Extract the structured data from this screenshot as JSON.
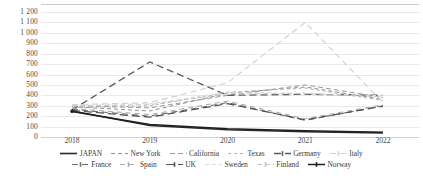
{
  "chart_data": {
    "type": "line",
    "title": "",
    "xlabel": "",
    "ylabel": "",
    "categories": [
      "2018",
      "2019",
      "2020",
      "2021",
      "2022"
    ],
    "x": [
      2018,
      2019,
      2020,
      2021,
      2022
    ],
    "ylim": [
      0,
      1200
    ],
    "y_ticks": [
      "0",
      "100",
      "200",
      "300",
      "400",
      "500",
      "600",
      "700",
      "800",
      "900",
      "1 000",
      "1 100",
      "1 200"
    ],
    "y_tick_values": [
      0,
      100,
      200,
      300,
      400,
      500,
      600,
      700,
      800,
      900,
      1000,
      1100,
      1200
    ],
    "grid": true,
    "legend_position": "bottom",
    "series": [
      {
        "name": "JAPAN",
        "values": [
          250,
          110,
          70,
          50,
          40
        ],
        "color": "#2b2b2b",
        "dash": "none",
        "width": 1.6,
        "marker": "none"
      },
      {
        "name": "New York",
        "values": [
          290,
          250,
          420,
          480,
          360
        ],
        "color": "#8f8f8f",
        "dash": "4,3",
        "width": 1.0,
        "marker": "none"
      },
      {
        "name": "California",
        "values": [
          300,
          280,
          400,
          500,
          380
        ],
        "color": "#9a9a9a",
        "dash": "5,3",
        "width": 1.0,
        "marker": "none"
      },
      {
        "name": "Texas",
        "values": [
          280,
          300,
          430,
          470,
          350
        ],
        "color": "#b4b4b4",
        "dash": "3,3",
        "width": 1.0,
        "marker": "none"
      },
      {
        "name": "Germany",
        "values": [
          260,
          720,
          400,
          410,
          400
        ],
        "color": "#5a5a5a",
        "dash": "7,4",
        "width": 1.3,
        "marker": "dash"
      },
      {
        "name": "Italy",
        "values": [
          310,
          330,
          520,
          1100,
          330
        ],
        "color": "#cfcfcf",
        "dash": "6,4",
        "width": 1.1,
        "marker": "dash"
      },
      {
        "name": "France",
        "values": [
          265,
          200,
          330,
          160,
          300
        ],
        "color": "#6f6f6f",
        "dash": "6,4",
        "width": 1.1,
        "marker": "dash"
      },
      {
        "name": "Spain",
        "values": [
          275,
          215,
          345,
          175,
          310
        ],
        "color": "#a8a8a8",
        "dash": "5,4",
        "width": 1.0,
        "marker": "dash"
      },
      {
        "name": "UK",
        "values": [
          255,
          190,
          320,
          165,
          295
        ],
        "color": "#4f4f4f",
        "dash": "8,4",
        "width": 1.2,
        "marker": "dash"
      },
      {
        "name": "Sweden",
        "values": [
          305,
          320,
          430,
          420,
          395
        ],
        "color": "#dcdcdc",
        "dash": "4,3",
        "width": 1.0,
        "marker": "none"
      },
      {
        "name": "Finland",
        "values": [
          295,
          310,
          415,
          415,
          385
        ],
        "color": "#c4c4c4",
        "dash": "5,3",
        "width": 1.0,
        "marker": "dash"
      },
      {
        "name": "Norway",
        "values": [
          245,
          120,
          80,
          60,
          45
        ],
        "color": "#1f1f1f",
        "dash": "none",
        "width": 1.5,
        "marker": "dash"
      }
    ]
  },
  "legend": {
    "row1": [
      "JAPAN",
      "New York",
      "California",
      "Texas",
      "Germany",
      "Italy"
    ],
    "row2": [
      "France",
      "Spain",
      "UK",
      "Sweden",
      "Finland",
      "Norway"
    ]
  },
  "caption": {
    "text": ""
  }
}
